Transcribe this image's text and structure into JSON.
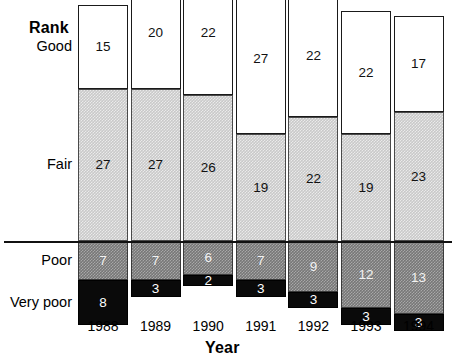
{
  "chart_data": {
    "type": "bar",
    "subtype": "stacked-bar",
    "title": "",
    "xlabel": "Year",
    "ylabel": "Rank",
    "grid": false,
    "legend_position": "y-axis-categories",
    "categories": [
      "1988",
      "1989",
      "1990",
      "1991",
      "1992",
      "1993",
      "1994"
    ],
    "series": [
      {
        "name": "Good",
        "values": [
          15,
          20,
          22,
          27,
          22,
          22,
          17
        ],
        "color": "#ffffff",
        "fill": "white"
      },
      {
        "name": "Fair",
        "values": [
          27,
          27,
          26,
          19,
          22,
          19,
          23
        ],
        "color": "#c9c9c9",
        "fill": "light-gray-dither"
      },
      {
        "name": "Poor",
        "values": [
          7,
          7,
          6,
          7,
          9,
          12,
          13
        ],
        "color": "#777777",
        "fill": "dark-gray-dither"
      },
      {
        "name": "Very poor",
        "values": [
          8,
          3,
          2,
          3,
          3,
          3,
          3
        ],
        "color": "#0a0a0a",
        "fill": "black"
      }
    ],
    "rank_labels": [
      "Good",
      "Fair",
      "Poor",
      "Very poor"
    ],
    "reference_line": {
      "description": "horizontal rule at Fair/Poor boundary",
      "color": "#111111"
    },
    "totals": [
      57,
      57,
      56,
      56,
      56,
      56,
      56
    ]
  },
  "axes": {
    "rank_label": "Rank",
    "year_label": "Year"
  },
  "rank_axis": {
    "items": [
      {
        "label": "Good"
      },
      {
        "label": "Fair"
      },
      {
        "label": "Poor"
      },
      {
        "label": "Very poor"
      }
    ]
  },
  "bars": [
    {
      "year": "1988",
      "segments": [
        {
          "rank": "Good",
          "value": "15"
        },
        {
          "rank": "Fair",
          "value": "27"
        },
        {
          "rank": "Poor",
          "value": "7"
        },
        {
          "rank": "Very poor",
          "value": "8"
        }
      ]
    },
    {
      "year": "1989",
      "segments": [
        {
          "rank": "Good",
          "value": "20"
        },
        {
          "rank": "Fair",
          "value": "27"
        },
        {
          "rank": "Poor",
          "value": "7"
        },
        {
          "rank": "Very poor",
          "value": "3"
        }
      ]
    },
    {
      "year": "1990",
      "segments": [
        {
          "rank": "Good",
          "value": "22"
        },
        {
          "rank": "Fair",
          "value": "26"
        },
        {
          "rank": "Poor",
          "value": "6"
        },
        {
          "rank": "Very poor",
          "value": "2"
        }
      ]
    },
    {
      "year": "1991",
      "segments": [
        {
          "rank": "Good",
          "value": "27"
        },
        {
          "rank": "Fair",
          "value": "19"
        },
        {
          "rank": "Poor",
          "value": "7"
        },
        {
          "rank": "Very poor",
          "value": "3"
        }
      ]
    },
    {
      "year": "1992",
      "segments": [
        {
          "rank": "Good",
          "value": "22"
        },
        {
          "rank": "Fair",
          "value": "22"
        },
        {
          "rank": "Poor",
          "value": "9"
        },
        {
          "rank": "Very poor",
          "value": "3"
        }
      ]
    },
    {
      "year": "1993",
      "segments": [
        {
          "rank": "Good",
          "value": "22"
        },
        {
          "rank": "Fair",
          "value": "19"
        },
        {
          "rank": "Poor",
          "value": "12"
        },
        {
          "rank": "Very poor",
          "value": "3"
        }
      ]
    },
    {
      "year": "1994",
      "segments": [
        {
          "rank": "Good",
          "value": "17"
        },
        {
          "rank": "Fair",
          "value": "23"
        },
        {
          "rank": "Poor",
          "value": "13"
        },
        {
          "rank": "Very poor",
          "value": "3"
        }
      ]
    }
  ]
}
